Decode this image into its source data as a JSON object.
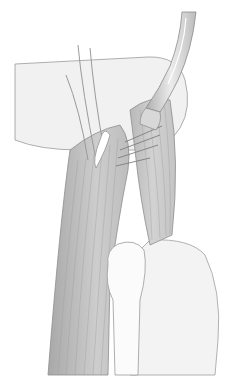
{
  "figure": {
    "colors": {
      "background": "#ffffff",
      "outline": "#8a8a8a",
      "muscle_dark": "#b5b5b5",
      "muscle_mid": "#cfcfcf",
      "muscle_light": "#e4e4e4",
      "bone": "#f4f4f4",
      "instrument": "#c8c8c8",
      "instrument_highlight": "#eeeeee"
    },
    "elements": [
      {
        "name": "upper-limb-segment",
        "shape": "horizontal rounded form upper left"
      },
      {
        "name": "forceps-instrument",
        "shape": "curved tool entering from top right"
      },
      {
        "name": "nerve-strands",
        "shape": "thin vertical lines near top center"
      },
      {
        "name": "muscle-tendon-bundle",
        "shape": "long striated diagonal band"
      },
      {
        "name": "bone-shaft",
        "shape": "lower center white rod with knob"
      },
      {
        "name": "joint-mass",
        "shape": "lower right light rounded form"
      }
    ]
  }
}
